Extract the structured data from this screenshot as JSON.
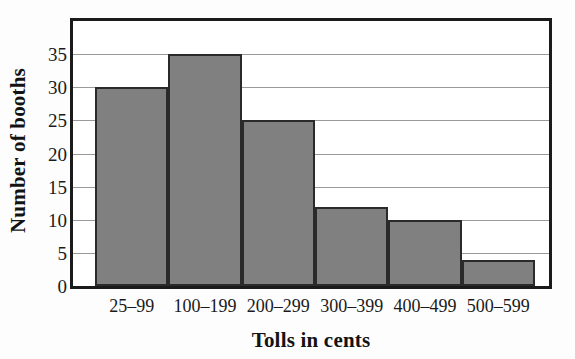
{
  "chart_data": {
    "type": "bar",
    "title": "",
    "xlabel": "Tolls in cents",
    "ylabel": "Number of booths",
    "categories": [
      "25–99",
      "100–199",
      "200–299",
      "300–399",
      "400–499",
      "500–599"
    ],
    "values": [
      30,
      35,
      25,
      12,
      10,
      4
    ],
    "ylim": [
      0,
      40
    ],
    "yticks": [
      0,
      5,
      10,
      15,
      20,
      25,
      30,
      35
    ],
    "ytick_labels": [
      "0",
      "5",
      "10",
      "15",
      "20",
      "25",
      "30",
      "35"
    ],
    "grid": true,
    "grid_axis": "y",
    "legend": false,
    "bar_color": "#808080",
    "bar_edge_color": "#2a2a2a",
    "axis_color": "#1b1b1b",
    "gridline_color": "#9a9a9a",
    "background_color": "#fdfdfd",
    "plot_background_color": "#ffffff"
  }
}
